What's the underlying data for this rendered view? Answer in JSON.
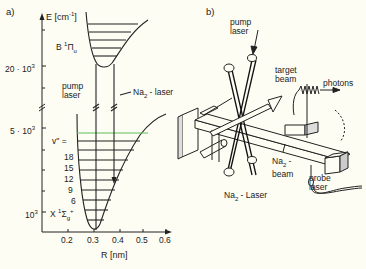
{
  "figure": {
    "panel_a": {
      "label": "a)",
      "y_axis": {
        "label": "E [cm",
        "label_sup": "-1",
        "label_end": "]",
        "ticks": [
          {
            "text": "20 · 10",
            "sup": "3"
          },
          {
            "text": "5 · 10",
            "sup": "3"
          },
          {
            "text": "10",
            "sup": "3"
          }
        ]
      },
      "x_axis": {
        "label": "R [nm]",
        "ticks": [
          "0.2",
          "0.3",
          "0.4",
          "0.5",
          "0.6"
        ]
      },
      "upper_state": {
        "text": "B ",
        "sup": "1",
        "sym": "Π",
        "sub": "u"
      },
      "lower_state": {
        "text": "X ",
        "sup": "1",
        "sym": "Σ",
        "sub": "g",
        "sup2": "+"
      },
      "vibrational_label": "v'' =",
      "vibrational_levels": [
        "18",
        "15",
        "12",
        "9",
        "6"
      ],
      "pump_laser": [
        "pump",
        "laser"
      ],
      "na2_laser": {
        "text": "Na",
        "sub": "2",
        "end": " - laser"
      }
    },
    "panel_b": {
      "label": "b)",
      "pump_laser": [
        "pump",
        "laser"
      ],
      "target_beam": [
        "target",
        "beam"
      ],
      "photons": "photons",
      "na2_beam": {
        "text": "Na",
        "sub": "2",
        "end": " -",
        "line2": "beam"
      },
      "probe_laser": [
        "probe",
        "laser"
      ],
      "na2_laser": {
        "text": "Na",
        "sub": "2",
        "end": " - Laser"
      }
    }
  }
}
